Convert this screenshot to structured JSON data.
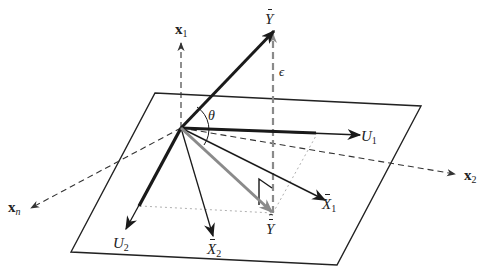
{
  "diagram": {
    "colors": {
      "plane": "#222222",
      "vector_dark": "#1a1a1a",
      "vector_gray": "#8a8a8a",
      "dashed_axis": "#333333",
      "dotted_guide": "#b0b0b0"
    },
    "labels": {
      "x1": {
        "base": "x",
        "sub": "1"
      },
      "x2": {
        "base": "x",
        "sub": "2"
      },
      "xn": {
        "base": "x",
        "sub": "n"
      },
      "ybar": {
        "base": "Y",
        "accent": "bar"
      },
      "yhat": {
        "base": "Y",
        "accent": "hat-bar"
      },
      "epsilon": {
        "text": "ϵ"
      },
      "theta": {
        "text": "θ"
      },
      "u1": {
        "base": "U",
        "sub": "1"
      },
      "u2": {
        "base": "U",
        "sub": "2"
      },
      "x1bar": {
        "base": "X",
        "sub": "1",
        "accent": "bar"
      },
      "x2bar": {
        "base": "X",
        "sub": "2",
        "accent": "bar"
      }
    }
  }
}
